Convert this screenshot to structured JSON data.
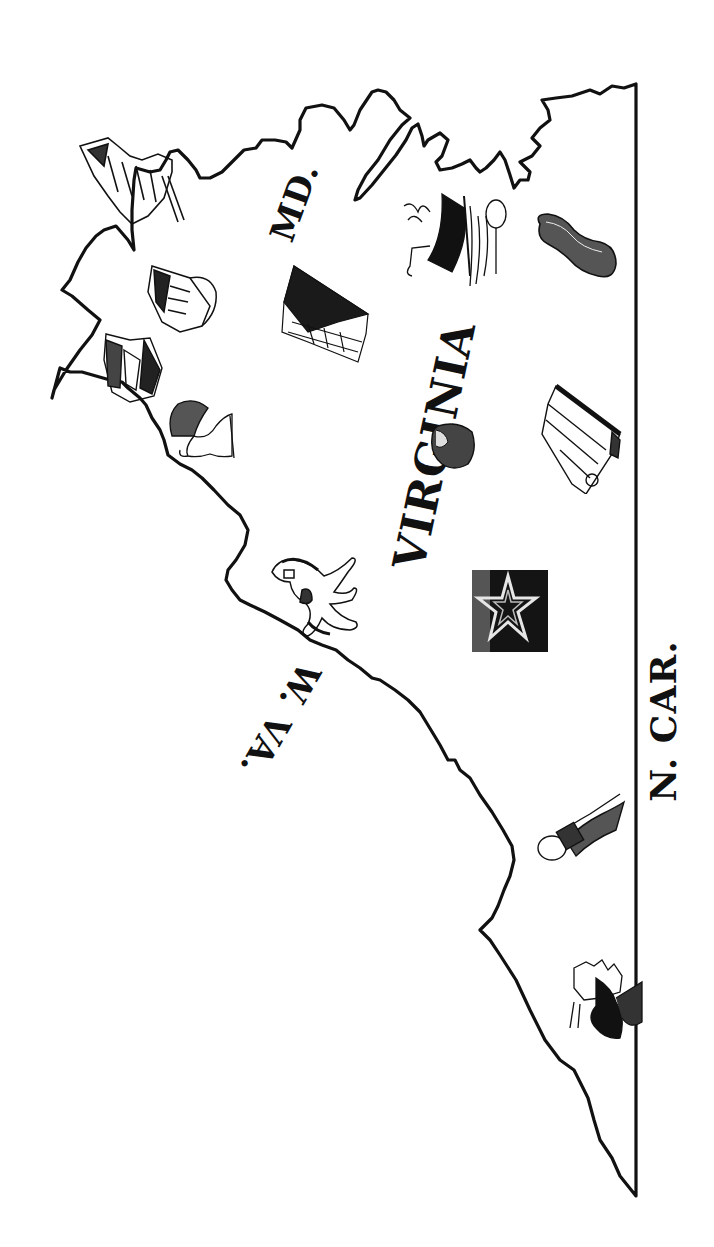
{
  "map": {
    "title": "Virginia",
    "orientation": "rotated 90° counter-clockwise",
    "colors": {
      "ink": "#111111",
      "background": "#ffffff"
    },
    "labels": {
      "state": "VIRGINIA",
      "maryland": "MD.",
      "west_virginia": "W. VA.",
      "north_carolina": "N. CAR."
    },
    "illustrations": [
      {
        "id": "colonial-buildings",
        "description": "Colonial buildings (Williamsburg / capitol)"
      },
      {
        "id": "mansion",
        "description": "Historic mansion house"
      },
      {
        "id": "barn",
        "description": "Farm barn"
      },
      {
        "id": "turkey",
        "description": "Turkey"
      },
      {
        "id": "horse",
        "description": "Horse"
      },
      {
        "id": "tobacco-field",
        "description": "Hatched field / crops"
      },
      {
        "id": "ship",
        "description": "Sailing ship with fishing nets"
      },
      {
        "id": "peanut",
        "description": "Peanut"
      },
      {
        "id": "ham",
        "description": "Virginia ham"
      },
      {
        "id": "star-block",
        "description": "Star emblem in dark square"
      },
      {
        "id": "textile-machine",
        "description": "Industrial machine / factory"
      },
      {
        "id": "coal-miner-lamp",
        "description": "Mining equipment"
      },
      {
        "id": "natural-bridge",
        "description": "Rock cliff / Natural Bridge"
      }
    ]
  }
}
